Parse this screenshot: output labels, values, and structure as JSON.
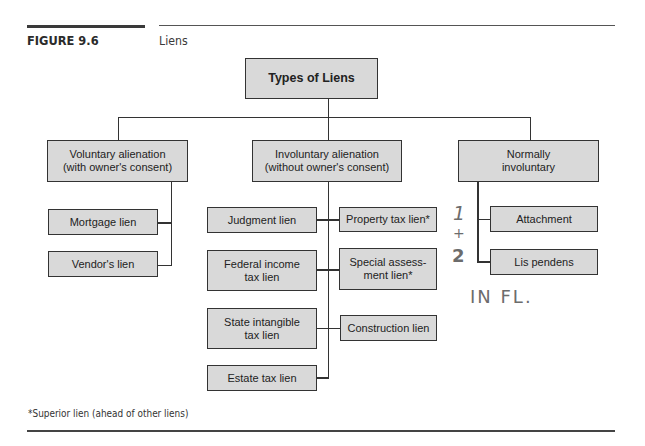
{
  "figure": {
    "label": "FIGURE 9.6",
    "title": "Liens"
  },
  "diagram": {
    "root": "Types of Liens",
    "categories": [
      {
        "label": "Voluntary alienation (with owner's consent)",
        "line1": "Voluntary alienation",
        "line2": "(with owner's consent)",
        "children": [
          "Mortgage lien",
          "Vendor's lien"
        ]
      },
      {
        "label": "Involuntary alienation (without owner's consent)",
        "line1": "Involuntary alienation",
        "line2": "(without owner's consent)",
        "children_left": [
          {
            "line1": "Judgment lien",
            "line2": ""
          },
          {
            "line1": "Federal income",
            "line2": "tax lien"
          },
          {
            "line1": "State intangible",
            "line2": "tax lien"
          },
          {
            "line1": "Estate tax lien",
            "line2": ""
          }
        ],
        "children_right": [
          {
            "line1": "Property tax lien*",
            "line2": ""
          },
          {
            "line1": "Special assess-",
            "line2": "ment lien*"
          },
          {
            "line1": "Construction lien",
            "line2": ""
          }
        ]
      },
      {
        "label": "Normally involuntary",
        "line1": "Normally",
        "line2": "involuntary",
        "children": [
          "Attachment",
          "Lis pendens"
        ]
      }
    ]
  },
  "annotations": {
    "handwritten_1": "1",
    "handwritten_plus": "+",
    "handwritten_2": "2",
    "handwritten_note": "IN FL."
  },
  "footnote": "*Superior lien (ahead of other liens)"
}
